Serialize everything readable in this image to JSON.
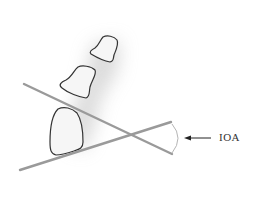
{
  "diagram": {
    "label": "IOA",
    "colors": {
      "lines": "#9a9a9a",
      "bone_outline": "#333333",
      "bone_fill": "#f6f6f6",
      "shadow": "#d8d8d8",
      "arrow": "#222222",
      "arc": "#b5b5b5"
    },
    "elements": [
      "bone-proximal-large",
      "bone-middle",
      "bone-distal",
      "line-upper",
      "line-lower",
      "angle-arc",
      "pointer-arrow"
    ]
  }
}
